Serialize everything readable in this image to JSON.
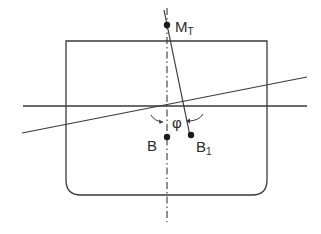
{
  "diagram": {
    "type": "ship-stability-cross-section",
    "colors": {
      "stroke": "#3a3a3a",
      "background": "#ffffff"
    },
    "labels": {
      "metacentre": {
        "main": "M",
        "sub": "T"
      },
      "centre_of_buoyancy": "B",
      "shifted_buoyancy": {
        "main": "B",
        "sub": "1"
      },
      "heel_angle": "φ"
    },
    "elements": [
      "hull-section-outline",
      "upright-waterline",
      "inclined-waterline",
      "centreline",
      "buoyancy-force-line",
      "heel-angle-arrows"
    ]
  }
}
